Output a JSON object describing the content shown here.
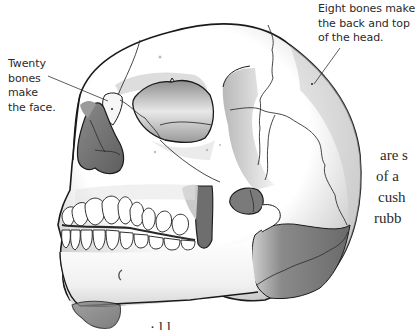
{
  "figure": {
    "colors": {
      "outline": "#1a1a1a",
      "bone": "#ffffff",
      "shade_light": "#d4d4d4",
      "shade_mid": "#9a9a9a",
      "shade_dark": "#6e6e6e",
      "suture": "#333333"
    }
  },
  "callouts": {
    "back_of_head": {
      "lines": [
        "Eight bones make",
        "the back and top",
        "of the head."
      ]
    },
    "face": {
      "lines": [
        "Twenty",
        "bones",
        "make",
        "the face."
      ]
    }
  },
  "body_text": {
    "lines": [
      "are s",
      "of a",
      "cush",
      "rubb"
    ]
  },
  "bottom_text": {
    "partial": "· l l . . ."
  }
}
